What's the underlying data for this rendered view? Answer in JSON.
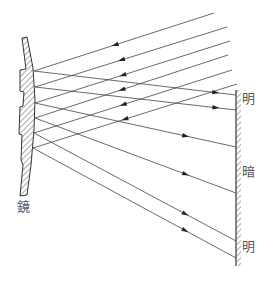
{
  "labels": {
    "mirror": "鏡",
    "bright_top": "明",
    "dark": "暗",
    "bright_bottom": "明"
  },
  "colors": {
    "line": "#444444",
    "hatch": "#555555",
    "text": "#555555"
  },
  "incoming_rays": [
    {
      "from": [
        214,
        13
      ],
      "to": [
        34,
        71
      ]
    },
    {
      "from": [
        227,
        27
      ],
      "to": [
        35,
        87
      ]
    },
    {
      "from": [
        230,
        41
      ],
      "to": [
        35,
        103
      ]
    },
    {
      "from": [
        228,
        55
      ],
      "to": [
        35,
        118
      ]
    },
    {
      "from": [
        232,
        70
      ],
      "to": [
        34,
        133
      ]
    },
    {
      "from": [
        237,
        84
      ],
      "to": [
        33,
        148
      ]
    }
  ],
  "reflected_rays": [
    {
      "from": [
        34,
        71
      ],
      "to": [
        236,
        95
      ]
    },
    {
      "from": [
        35,
        87
      ],
      "to": [
        236,
        110
      ]
    },
    {
      "from": [
        35,
        103
      ],
      "to": [
        236,
        147
      ]
    },
    {
      "from": [
        35,
        118
      ],
      "to": [
        236,
        193
      ]
    },
    {
      "from": [
        34,
        133
      ],
      "to": [
        236,
        241
      ]
    },
    {
      "from": [
        33,
        148
      ],
      "to": [
        236,
        258
      ]
    }
  ]
}
